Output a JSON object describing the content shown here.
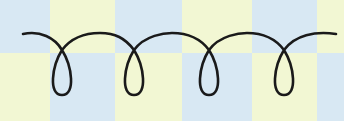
{
  "figure": {
    "colors": {
      "cell_a": "#d8e8f3",
      "cell_b": "#f2f7d3",
      "stroke": "#1a1a1a"
    },
    "loop_count": 4
  }
}
